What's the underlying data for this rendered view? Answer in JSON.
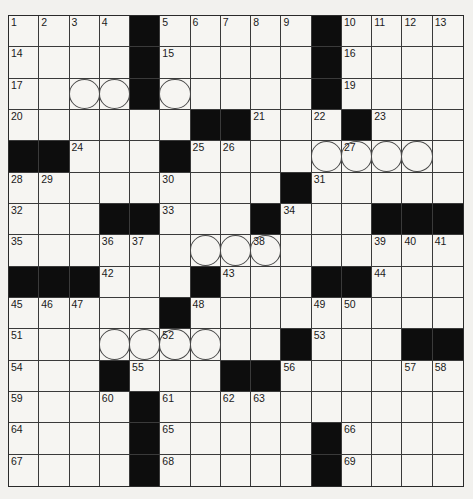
{
  "puzzle": {
    "size": {
      "rows": 15,
      "cols": 15
    },
    "legend": {
      "#": "black-square",
      ".": "white-square"
    },
    "layout": [
      "....#.....#....",
      "....#.....#....",
      "....#.....#....",
      "......##...#...",
      "##...#.........",
      ".........#.....",
      "...##...#...###",
      "...............",
      "###...#...##...",
      ".....#.........",
      ".........#...##",
      "...#...##......",
      "....#..........",
      "....#.....#....",
      "....#.....#...."
    ],
    "numbers": [
      {
        "r": 0,
        "c": 0,
        "n": "1"
      },
      {
        "r": 0,
        "c": 1,
        "n": "2"
      },
      {
        "r": 0,
        "c": 2,
        "n": "3"
      },
      {
        "r": 0,
        "c": 3,
        "n": "4"
      },
      {
        "r": 0,
        "c": 5,
        "n": "5"
      },
      {
        "r": 0,
        "c": 6,
        "n": "6"
      },
      {
        "r": 0,
        "c": 7,
        "n": "7"
      },
      {
        "r": 0,
        "c": 8,
        "n": "8"
      },
      {
        "r": 0,
        "c": 9,
        "n": "9"
      },
      {
        "r": 0,
        "c": 11,
        "n": "10"
      },
      {
        "r": 0,
        "c": 12,
        "n": "11"
      },
      {
        "r": 0,
        "c": 13,
        "n": "12"
      },
      {
        "r": 0,
        "c": 14,
        "n": "13"
      },
      {
        "r": 1,
        "c": 0,
        "n": "14"
      },
      {
        "r": 1,
        "c": 5,
        "n": "15"
      },
      {
        "r": 1,
        "c": 11,
        "n": "16"
      },
      {
        "r": 2,
        "c": 0,
        "n": "17"
      },
      {
        "r": 2,
        "c": 4,
        "n": "18"
      },
      {
        "r": 2,
        "c": 11,
        "n": "19"
      },
      {
        "r": 3,
        "c": 0,
        "n": "20"
      },
      {
        "r": 3,
        "c": 8,
        "n": "21"
      },
      {
        "r": 3,
        "c": 10,
        "n": "22"
      },
      {
        "r": 3,
        "c": 12,
        "n": "23"
      },
      {
        "r": 4,
        "c": 2,
        "n": "24"
      },
      {
        "r": 4,
        "c": 6,
        "n": "25"
      },
      {
        "r": 4,
        "c": 7,
        "n": "26"
      },
      {
        "r": 4,
        "c": 11,
        "n": "27"
      },
      {
        "r": 5,
        "c": 0,
        "n": "28"
      },
      {
        "r": 5,
        "c": 1,
        "n": "29"
      },
      {
        "r": 5,
        "c": 5,
        "n": "30"
      },
      {
        "r": 5,
        "c": 10,
        "n": "31"
      },
      {
        "r": 6,
        "c": 0,
        "n": "32"
      },
      {
        "r": 6,
        "c": 5,
        "n": "33"
      },
      {
        "r": 6,
        "c": 9,
        "n": "34"
      },
      {
        "r": 7,
        "c": 0,
        "n": "35"
      },
      {
        "r": 7,
        "c": 3,
        "n": "36"
      },
      {
        "r": 7,
        "c": 4,
        "n": "37"
      },
      {
        "r": 7,
        "c": 8,
        "n": "38"
      },
      {
        "r": 7,
        "c": 12,
        "n": "39"
      },
      {
        "r": 7,
        "c": 13,
        "n": "40"
      },
      {
        "r": 7,
        "c": 14,
        "n": "41"
      },
      {
        "r": 8,
        "c": 3,
        "n": "42"
      },
      {
        "r": 8,
        "c": 7,
        "n": "43"
      },
      {
        "r": 8,
        "c": 12,
        "n": "44"
      },
      {
        "r": 9,
        "c": 0,
        "n": "45"
      },
      {
        "r": 9,
        "c": 1,
        "n": "46"
      },
      {
        "r": 9,
        "c": 2,
        "n": "47"
      },
      {
        "r": 9,
        "c": 6,
        "n": "48"
      },
      {
        "r": 9,
        "c": 10,
        "n": "49"
      },
      {
        "r": 9,
        "c": 11,
        "n": "50"
      },
      {
        "r": 10,
        "c": 0,
        "n": "51"
      },
      {
        "r": 10,
        "c": 5,
        "n": "52"
      },
      {
        "r": 10,
        "c": 10,
        "n": "53"
      },
      {
        "r": 11,
        "c": 0,
        "n": "54"
      },
      {
        "r": 11,
        "c": 4,
        "n": "55"
      },
      {
        "r": 11,
        "c": 9,
        "n": "56"
      },
      {
        "r": 11,
        "c": 13,
        "n": "57"
      },
      {
        "r": 11,
        "c": 14,
        "n": "58"
      },
      {
        "r": 12,
        "c": 0,
        "n": "59"
      },
      {
        "r": 12,
        "c": 3,
        "n": "60"
      },
      {
        "r": 12,
        "c": 5,
        "n": "61"
      },
      {
        "r": 12,
        "c": 7,
        "n": "62"
      },
      {
        "r": 12,
        "c": 8,
        "n": "63"
      },
      {
        "r": 13,
        "c": 0,
        "n": "64"
      },
      {
        "r": 13,
        "c": 5,
        "n": "65"
      },
      {
        "r": 13,
        "c": 11,
        "n": "66"
      },
      {
        "r": 14,
        "c": 0,
        "n": "67"
      },
      {
        "r": 14,
        "c": 5,
        "n": "68"
      },
      {
        "r": 14,
        "c": 11,
        "n": "69"
      }
    ],
    "circles": [
      {
        "r": 2,
        "c": 2
      },
      {
        "r": 2,
        "c": 3
      },
      {
        "r": 2,
        "c": 4
      },
      {
        "r": 2,
        "c": 5
      },
      {
        "r": 4,
        "c": 10
      },
      {
        "r": 4,
        "c": 11
      },
      {
        "r": 4,
        "c": 12
      },
      {
        "r": 4,
        "c": 13
      },
      {
        "r": 7,
        "c": 6
      },
      {
        "r": 7,
        "c": 7
      },
      {
        "r": 7,
        "c": 8
      },
      {
        "r": 10,
        "c": 3
      },
      {
        "r": 10,
        "c": 4
      },
      {
        "r": 10,
        "c": 5
      },
      {
        "r": 10,
        "c": 6
      }
    ],
    "entries": {}
  }
}
